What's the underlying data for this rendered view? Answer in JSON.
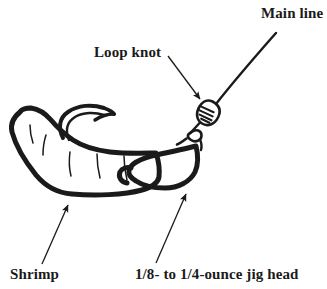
{
  "figure": {
    "background_color": "#ffffff",
    "ink_color": "#1a1a1a",
    "width": 327,
    "height": 289
  },
  "labels": {
    "main_line": "Main line",
    "loop_knot": "Loop knot",
    "shrimp": "Shrimp",
    "jig_head": "1/8- to 1/4-ounce jig head"
  },
  "parts": {
    "main_line": "main-line",
    "loop_knot": "loop-knot",
    "jig_head": "jig-head",
    "shrimp_body": "shrimp-body",
    "hook_point": "hook-point"
  },
  "leaders": {
    "loop_knot_arrow": "arrow pointing down-right to knot",
    "shrimp_arrow": "arrow pointing up-right to shrimp body",
    "jig_head_arrow": "arrow pointing up-right to jig head"
  }
}
